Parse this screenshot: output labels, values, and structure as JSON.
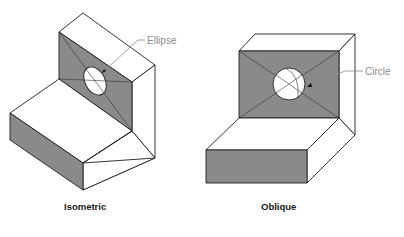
{
  "figures": [
    {
      "id": "isometric",
      "caption": "Isometric",
      "callout": "Ellipse"
    },
    {
      "id": "oblique",
      "caption": "Oblique",
      "callout": "Circle"
    }
  ],
  "colors": {
    "face_shaded": "#8a8a8a",
    "face_light": "#ffffff",
    "edge": "#1e1e1e",
    "callout_text": "#8c8c8c",
    "caption_text": "#1a1a1a"
  }
}
